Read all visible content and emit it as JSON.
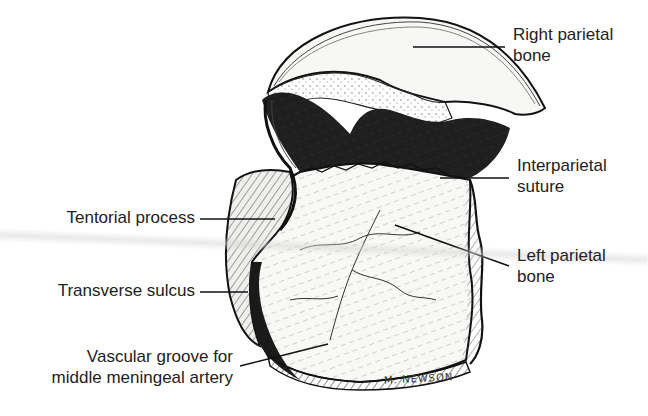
{
  "figure": {
    "artist_signature": "M. NEWSON",
    "colors": {
      "ink": "#111111",
      "bone_fill": "#f6f6f4",
      "shadow": "#1c1c1c",
      "label_text": "#222222",
      "leader_line": "#111111"
    }
  },
  "labels": {
    "right_parietal_bone": {
      "line1": "Right parietal",
      "line2": "bone"
    },
    "interparietal_suture": {
      "line1": "Interparietal",
      "line2": "suture"
    },
    "left_parietal_bone": {
      "line1": "Left parietal",
      "line2": "bone"
    },
    "tentorial_process": {
      "line1": "Tentorial process"
    },
    "transverse_sulcus": {
      "line1": "Transverse sulcus"
    },
    "vascular_groove": {
      "line1": "Vascular groove for",
      "line2": "middle meningeal artery"
    }
  }
}
